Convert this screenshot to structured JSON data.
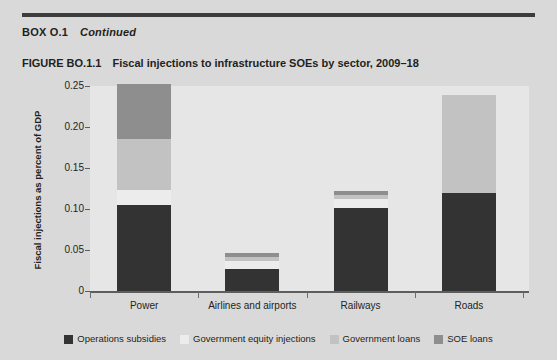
{
  "box": {
    "label": "BOX O.1",
    "status": "Continued"
  },
  "figure": {
    "number": "FIGURE BO.1.1",
    "title": "Fiscal injections to infrastructure SOEs by sector, 2009–18"
  },
  "colors": {
    "page_background": "#d9d9d9",
    "plot_background": "#e6e6e6",
    "rule": "#3c3c3c",
    "axis": "#5d5d5d",
    "operations_subsidies": "#333333",
    "government_equity_injections": "#ececec",
    "government_loans": "#c2c2c2",
    "soe_loans": "#8e8e8e"
  },
  "chart_data": {
    "type": "bar",
    "stacked": true,
    "title": "Fiscal injections to infrastructure SOEs by sector, 2009–18",
    "xlabel": "",
    "ylabel": "Fiscal injections as percent of GDP",
    "categories": [
      "Power",
      "Airlines and airports",
      "Railways",
      "Roads"
    ],
    "series": [
      {
        "name": "Operations subsidies",
        "color": "#333333",
        "values": [
          0.105,
          0.027,
          0.101,
          0.119
        ]
      },
      {
        "name": "Government equity injections",
        "color": "#ececec",
        "values": [
          0.018,
          0.01,
          0.011,
          0.001
        ]
      },
      {
        "name": "Government loans",
        "color": "#c2c2c2",
        "values": [
          0.062,
          0.005,
          0.005,
          0.119
        ]
      },
      {
        "name": "SOE loans",
        "color": "#8e8e8e",
        "values": [
          0.067,
          0.004,
          0.005,
          0.0
        ]
      }
    ],
    "totals": [
      0.252,
      0.046,
      0.122,
      0.239
    ],
    "ylim": [
      0,
      0.25
    ],
    "yticks": [
      0,
      0.05,
      0.1,
      0.15,
      0.2,
      0.25
    ],
    "ytick_labels": [
      "0",
      "0.05",
      "0.10",
      "0.15",
      "0.20",
      "0.25"
    ],
    "grid": false,
    "legend_position": "bottom"
  }
}
